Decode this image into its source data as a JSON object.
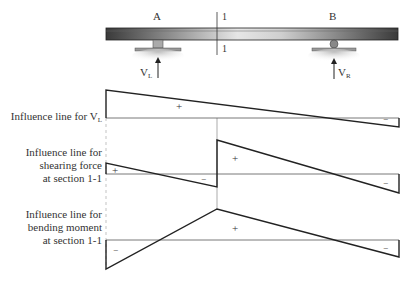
{
  "beam": {
    "support_a_label": "A",
    "support_b_label": "B",
    "section_label_top": "1",
    "section_label_bottom": "1",
    "reaction_left": {
      "main": "V",
      "sub": "L"
    },
    "reaction_right": {
      "main": "V",
      "sub": "R"
    }
  },
  "diagrams": [
    {
      "title_lines": [
        "Influence line for V"
      ],
      "title_sub": "L",
      "signs": [
        "+",
        "−"
      ]
    },
    {
      "title_lines": [
        "Influence line for",
        "shearing force",
        "at section 1-1"
      ],
      "signs": [
        "+",
        "−",
        "+",
        "−"
      ]
    },
    {
      "title_lines": [
        "Influence line for",
        "bending moment",
        "at section 1-1"
      ],
      "signs": [
        "−",
        "+",
        "−"
      ]
    }
  ],
  "colors": {
    "line": "#222222",
    "beam_dark": "#3a3a3a",
    "beam_light": "#d8d8d8",
    "support": "#9a9a9a"
  }
}
